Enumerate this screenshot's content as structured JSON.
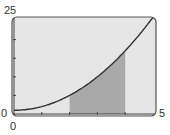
{
  "chart_data": {
    "type": "area",
    "title": "",
    "xlabel": "",
    "ylabel": "",
    "function": "y = x^2 + 1",
    "x": [
      0,
      0.5,
      1,
      1.5,
      2,
      2.5,
      3,
      3.5,
      4,
      4.5,
      5
    ],
    "series": [
      {
        "name": "curve",
        "values": [
          1,
          1.25,
          2,
          3.25,
          5,
          7.25,
          10,
          13.25,
          17,
          21.25,
          26
        ]
      }
    ],
    "shaded_region": {
      "x_from": 2,
      "x_to": 4
    },
    "xlim": [
      0,
      5
    ],
    "ylim": [
      0,
      25
    ],
    "x_ticks": [
      1,
      2,
      3,
      4
    ],
    "y_ticks": [
      5,
      10,
      15,
      20
    ],
    "grid": false,
    "colors": {
      "background": "#e6e6e6",
      "shade": "#a9a9a9",
      "curve": "#333333",
      "frame": "#555555"
    }
  },
  "labels": {
    "y_max": "25",
    "y_min": "0",
    "x_min": "0",
    "x_max": "5"
  }
}
